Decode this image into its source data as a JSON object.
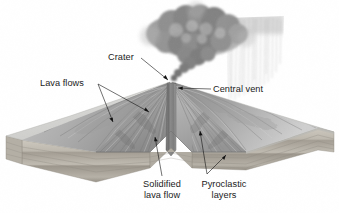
{
  "figure": {
    "background_color": "#ffffff",
    "width": 339,
    "height": 213
  },
  "labels": {
    "crater": "Crater",
    "lava_flows": "Lava flows",
    "central_vent": "Central vent",
    "solidified_lava_flow_line1": "Solidified",
    "solidified_lava_flow_line2": "lava flow",
    "pyroclastic_layers_line1": "Pyroclastic",
    "pyroclastic_layers_line2": "layers"
  },
  "parts": {
    "ash_cloud": "ash-cloud",
    "ash_fall": "ash-fall-streaks",
    "volcano_cone": "volcano-cone",
    "central_vent_conduit": "central-vent-conduit",
    "cutaway_wedge": "cutaway-wedge",
    "ground_block_left": "ground-block-left",
    "ground_block_right": "ground-block-right",
    "strata_layers": "strata-layers",
    "crater_point": "crater-summit"
  },
  "colors": {
    "background": "#ffffff",
    "ash_cloud_dark": "#6e6e6e",
    "ash_cloud_mid": "#909090",
    "ash_cloud_light": "#bcbcbc",
    "ash_fall": "#b8b8b8",
    "cone_dark": "#8d8d8d",
    "cone_mid": "#a7a7a7",
    "cone_light": "#c9c9c9",
    "vent_fill": "#848484",
    "plain_light": "#dcdcdc",
    "plain_mid": "#c6c6c6",
    "strata_a": "#d6d2c9",
    "strata_b": "#bfbab0",
    "strata_c": "#a9a49a",
    "label_text": "#1b1b1b",
    "leader_line": "#111111"
  }
}
